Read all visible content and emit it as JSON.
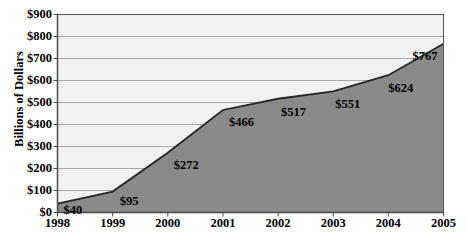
{
  "chart_data": {
    "type": "area",
    "title": "",
    "xlabel": "",
    "ylabel": "Billions of Dollars",
    "categories": [
      "1998",
      "1999",
      "2000",
      "2001",
      "2002",
      "2003",
      "2004",
      "2005"
    ],
    "values": [
      40,
      95,
      272,
      466,
      517,
      551,
      624,
      767
    ],
    "point_labels": [
      "$40",
      "$95",
      "$272",
      "$466",
      "$517",
      "$551",
      "$624",
      "$767"
    ],
    "ylim": [
      0,
      900
    ],
    "ytick_values": [
      0,
      100,
      200,
      300,
      400,
      500,
      600,
      700,
      800,
      900
    ],
    "ytick_labels": [
      "$0",
      "$100",
      "$200",
      "$300",
      "$400",
      "$500",
      "$600",
      "$700",
      "$800",
      "$900"
    ],
    "grid": true,
    "legend": "none",
    "colors": {
      "area_fill": "#8a8a8a",
      "line": "#262626",
      "plot_background": "#f1f1f1",
      "gridline": "#a9a9a9",
      "axis": "#555555",
      "text": "#000000"
    }
  }
}
